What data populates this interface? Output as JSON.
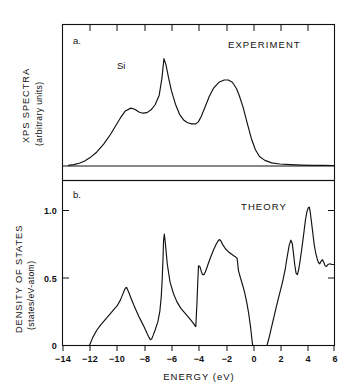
{
  "figure": {
    "background_color": "#ffffff",
    "line_color": "#111111"
  },
  "panels": {
    "top": {
      "letter": "a.",
      "annotation": "EXPERIMENT",
      "species_label": "Si",
      "y_axis_label_line1": "XPS SPECTRA",
      "y_axis_label_line2": "(arbitrary units)"
    },
    "bottom": {
      "letter": "b.",
      "annotation": "THEORY",
      "y_axis_label_line1": "DENSITY OF STATES",
      "y_axis_label_line2": "(states/eV-atom)"
    }
  },
  "axes": {
    "x_title": "ENERGY  (eV)",
    "x_tick_labels": [
      "−14",
      "−12",
      "−10",
      "−8",
      "−6",
      "−4",
      "−2",
      "0",
      "2",
      "4",
      "6"
    ],
    "x_tick_values": [
      -14,
      -12,
      -10,
      -8,
      -6,
      -4,
      -2,
      0,
      2,
      4,
      6
    ],
    "y_tick_labels_bottom": [
      "0",
      "0.5",
      "1.0"
    ],
    "y_tick_values_bottom": [
      0,
      0.5,
      1.0
    ]
  },
  "chart_data": {
    "type": "line",
    "xlabel": "ENERGY  (eV)",
    "xlim": [
      -14,
      6
    ],
    "grid": false,
    "legend": "none",
    "subplots": [
      {
        "id": "a",
        "label": "a.",
        "annotation": "EXPERIMENT",
        "species": "Si",
        "ylabel": "XPS SPECTRA (arbitrary units)",
        "ylim": [
          0,
          1.05
        ],
        "y_ticks_shown": false,
        "series": [
          {
            "name": "Si XPS spectrum (experiment)",
            "x": [
              -13.6,
              -13.2,
              -12.8,
              -12.4,
              -12.0,
              -11.5,
              -11.0,
              -10.5,
              -10.1,
              -9.7,
              -9.4,
              -9.0,
              -8.7,
              -8.4,
              -8.1,
              -7.8,
              -7.5,
              -7.2,
              -6.9,
              -6.7,
              -6.55,
              -6.4,
              -6.2,
              -6.0,
              -5.7,
              -5.4,
              -5.1,
              -4.8,
              -4.5,
              -4.2,
              -4.0,
              -3.8,
              -3.5,
              -3.2,
              -2.9,
              -2.5,
              -2.1,
              -1.8,
              -1.5,
              -1.2,
              -1.0,
              -0.7,
              -0.4,
              -0.1,
              0.2,
              0.5,
              0.9,
              1.4,
              2.0,
              2.8,
              3.6,
              4.4,
              5.2,
              6.0
            ],
            "y": [
              0.005,
              0.012,
              0.025,
              0.045,
              0.075,
              0.125,
              0.195,
              0.28,
              0.36,
              0.44,
              0.49,
              0.515,
              0.505,
              0.48,
              0.47,
              0.475,
              0.5,
              0.545,
              0.63,
              0.78,
              0.955,
              0.9,
              0.78,
              0.67,
              0.55,
              0.46,
              0.41,
              0.385,
              0.375,
              0.375,
              0.395,
              0.44,
              0.53,
              0.62,
              0.69,
              0.745,
              0.765,
              0.765,
              0.745,
              0.69,
              0.63,
              0.52,
              0.38,
              0.245,
              0.145,
              0.085,
              0.05,
              0.028,
              0.018,
              0.012,
              0.008,
              0.006,
              0.005,
              0.004
            ]
          }
        ]
      },
      {
        "id": "b",
        "label": "b.",
        "annotation": "THEORY",
        "ylabel": "DENSITY OF STATES (states/eV-atom)",
        "ylim": [
          0,
          1.18
        ],
        "y_ticks": [
          0,
          0.5,
          1.0
        ],
        "series": [
          {
            "name": "Valence band DOS",
            "x": [
              -12.05,
              -11.8,
              -11.5,
              -11.2,
              -10.9,
              -10.6,
              -10.3,
              -10.0,
              -9.75,
              -9.55,
              -9.4,
              -9.3,
              -9.15,
              -9.0,
              -8.8,
              -8.6,
              -8.4,
              -8.2,
              -8.0,
              -7.8,
              -7.65,
              -7.55,
              -7.45,
              -7.35,
              -7.2,
              -7.0,
              -6.85,
              -6.75,
              -6.68,
              -6.62,
              -6.58,
              -6.52,
              -6.45,
              -6.3,
              -6.1,
              -5.85,
              -5.6,
              -5.3,
              -5.0,
              -4.7,
              -4.5,
              -4.35,
              -4.25,
              -4.2,
              -4.12,
              -4.05,
              -4.0,
              -3.9,
              -3.78,
              -3.7,
              -3.6,
              -3.5,
              -3.42,
              -3.3,
              -3.1,
              -2.9,
              -2.7,
              -2.55,
              -2.45,
              -2.35,
              -2.2,
              -2.0,
              -1.8,
              -1.6,
              -1.4,
              -1.25,
              -1.15,
              -1.05,
              -0.9,
              -0.75,
              -0.6,
              -0.45,
              -0.3,
              -0.15,
              -0.05,
              0.0
            ],
            "y": [
              0.0,
              0.06,
              0.115,
              0.155,
              0.19,
              0.225,
              0.26,
              0.295,
              0.34,
              0.39,
              0.425,
              0.43,
              0.395,
              0.355,
              0.305,
              0.26,
              0.215,
              0.175,
              0.135,
              0.09,
              0.06,
              0.043,
              0.05,
              0.075,
              0.115,
              0.175,
              0.255,
              0.36,
              0.49,
              0.64,
              0.775,
              0.825,
              0.76,
              0.6,
              0.47,
              0.385,
              0.325,
              0.275,
              0.24,
              0.205,
              0.18,
              0.16,
              0.145,
              0.14,
              0.3,
              0.48,
              0.59,
              0.585,
              0.545,
              0.525,
              0.525,
              0.545,
              0.565,
              0.6,
              0.655,
              0.705,
              0.75,
              0.775,
              0.785,
              0.775,
              0.745,
              0.715,
              0.695,
              0.68,
              0.665,
              0.655,
              0.645,
              0.555,
              0.5,
              0.45,
              0.395,
              0.325,
              0.24,
              0.13,
              0.04,
              0.0
            ]
          },
          {
            "name": "Conduction band DOS",
            "x": [
              1.05,
              1.2,
              1.4,
              1.6,
              1.8,
              2.0,
              2.2,
              2.4,
              2.55,
              2.7,
              2.82,
              2.92,
              3.0,
              3.1,
              3.2,
              3.3,
              3.4,
              3.5,
              3.6,
              3.7,
              3.8,
              3.9,
              4.0,
              4.1,
              4.18,
              4.25,
              4.35,
              4.45,
              4.55,
              4.65,
              4.75,
              4.85,
              4.95,
              5.05,
              5.15,
              5.25,
              5.35,
              5.45,
              5.55,
              5.7,
              5.85,
              6.0
            ],
            "y": [
              0.0,
              0.055,
              0.14,
              0.225,
              0.31,
              0.39,
              0.47,
              0.565,
              0.66,
              0.745,
              0.78,
              0.755,
              0.69,
              0.6,
              0.535,
              0.525,
              0.565,
              0.63,
              0.7,
              0.775,
              0.855,
              0.935,
              0.99,
              1.02,
              1.025,
              0.985,
              0.905,
              0.82,
              0.74,
              0.685,
              0.645,
              0.615,
              0.605,
              0.625,
              0.635,
              0.615,
              0.59,
              0.585,
              0.6,
              0.605,
              0.6,
              0.6
            ]
          }
        ]
      }
    ]
  }
}
